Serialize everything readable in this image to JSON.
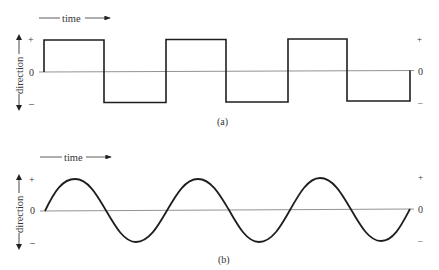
{
  "figure": {
    "panels": [
      {
        "id": "a",
        "caption": "(a)",
        "time_label": "time",
        "direction_label": "direction",
        "left_ticks": {
          "plus": "+",
          "zero": "0",
          "minus": "–"
        },
        "right_ticks": {
          "plus": "+",
          "zero": "0",
          "minus": "–"
        },
        "waveform": "square"
      },
      {
        "id": "b",
        "caption": "(b)",
        "time_label": "time",
        "direction_label": "direction",
        "left_ticks": {
          "plus": "+",
          "zero": "0",
          "minus": "–"
        },
        "right_ticks": {
          "plus": "+",
          "zero": "0",
          "minus": "–"
        },
        "waveform": "sine"
      }
    ]
  },
  "colors": {
    "line": "#1e1e1e",
    "axis": "#777777",
    "text": "#333333"
  }
}
